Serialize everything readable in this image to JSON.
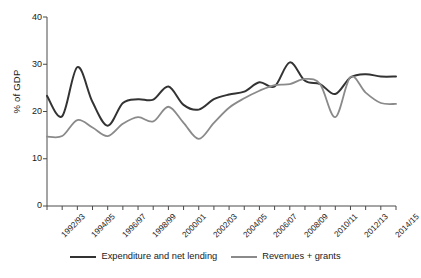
{
  "chart_data": {
    "type": "line",
    "title": "",
    "xlabel": "",
    "ylabel": "% of GDP",
    "ylim": [
      0,
      40
    ],
    "yticks": [
      0,
      10,
      20,
      30,
      40
    ],
    "grid": false,
    "legend_position": "bottom",
    "categories": [
      "1992/93",
      "1993/94",
      "1994/95",
      "1995/96",
      "1996/97",
      "1997/98",
      "1998/99",
      "1999/00",
      "2000/01",
      "2001/02",
      "2002/03",
      "2003/04",
      "2004/05",
      "2005/06",
      "2006/07",
      "2007/08",
      "2008/09",
      "2009/10",
      "2010/11",
      "2011/12",
      "2012/13",
      "2013/14",
      "2014/15",
      "2015/16"
    ],
    "tick_labels": [
      "1992/93",
      "1994/95",
      "1996/97",
      "1998/99",
      "2000/01",
      "2002/03",
      "2004/05",
      "2006/07",
      "2008/09",
      "2010/11",
      "2012/13",
      "2014/15"
    ],
    "series": [
      {
        "name": "Expenditure and net lending",
        "color": "#333333",
        "values": [
          23.3,
          19.0,
          29.4,
          22.0,
          17.0,
          21.8,
          22.6,
          22.5,
          25.3,
          21.4,
          20.4,
          22.6,
          23.6,
          24.2,
          26.2,
          25.3,
          30.4,
          26.5,
          25.8,
          23.7,
          27.2,
          27.9,
          27.4,
          27.4
        ]
      },
      {
        "name": "Revenues + grants",
        "color": "#8a8a8a",
        "values": [
          14.7,
          14.8,
          18.2,
          16.6,
          14.8,
          17.4,
          18.8,
          17.9,
          21.0,
          17.6,
          14.2,
          17.6,
          20.8,
          22.8,
          24.4,
          25.6,
          25.8,
          26.9,
          25.8,
          18.8,
          27.3,
          24.0,
          21.8,
          21.6
        ]
      }
    ]
  },
  "legend": {
    "items": [
      {
        "label": "Expenditure and net lending"
      },
      {
        "label": "Revenues + grants"
      }
    ]
  },
  "axes": {
    "y_title": "% of GDP",
    "y_tick_labels": [
      "40",
      "30",
      "20",
      "10",
      "0"
    ]
  }
}
